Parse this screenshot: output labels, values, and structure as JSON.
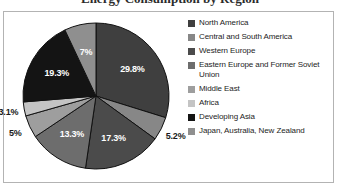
{
  "chart_data": {
    "type": "pie",
    "title": "Energy Consumption by Region",
    "categories": [
      "North America",
      "Central and South America",
      "Western Europe",
      "Eastern Europe and Former Soviet Union",
      "Middle East",
      "Africa",
      "Developing Asia",
      "Japan, Australia, New Zealand"
    ],
    "values": [
      29.8,
      5.2,
      17.3,
      13.3,
      5.0,
      3.1,
      19.3,
      7.0
    ],
    "value_labels": [
      "29.8%",
      "5.2%",
      "17.3%",
      "13.3%",
      "5%",
      "3.1%",
      "19.3%",
      "7%"
    ],
    "colors": [
      "#3f3f3f",
      "#878787",
      "#4b4b4b",
      "#6d6d6d",
      "#9e9e9e",
      "#c4c4c4",
      "#141414",
      "#8f8f8f"
    ],
    "units": "percent",
    "legend_position": "right",
    "grid": false,
    "xlabel": "",
    "ylabel": ""
  },
  "legend": {
    "items": [
      {
        "label": "North America",
        "color": "#3f3f3f"
      },
      {
        "label": "Central and South America",
        "color": "#878787"
      },
      {
        "label": "Western Europe",
        "color": "#4b4b4b"
      },
      {
        "label": "Eastern Europe and Former Soviet Union",
        "color": "#6d6d6d"
      },
      {
        "label": "Middle East",
        "color": "#9e9e9e"
      },
      {
        "label": "Africa",
        "color": "#c4c4c4"
      },
      {
        "label": "Developing Asia",
        "color": "#141414"
      },
      {
        "label": "Japan, Australia, New Zealand",
        "color": "#8f8f8f"
      }
    ]
  },
  "style": {
    "panel_border": "#b3b3b3",
    "pie_outline": "#111111",
    "background": "#ffffff"
  }
}
